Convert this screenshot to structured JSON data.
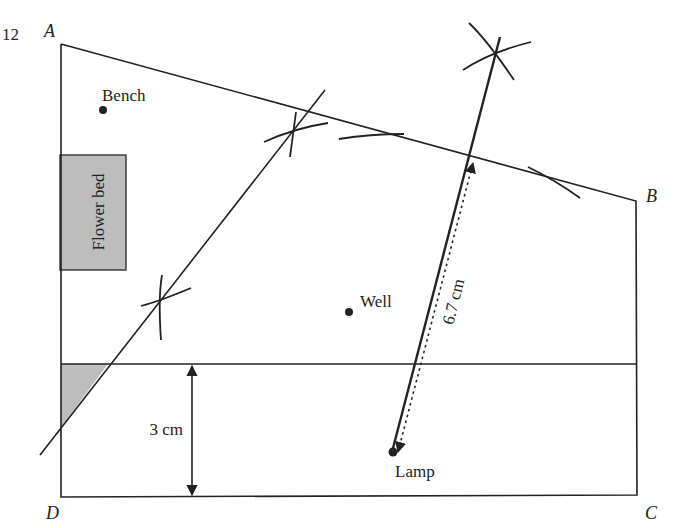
{
  "question_number": "12",
  "vertices": {
    "A": {
      "label": "A",
      "x": 61,
      "y": 44
    },
    "B": {
      "label": "B",
      "x": 636,
      "y": 201
    },
    "C": {
      "label": "C",
      "x": 637,
      "y": 495
    },
    "D": {
      "label": "D",
      "x": 61,
      "y": 497
    }
  },
  "points": {
    "bench": {
      "label": "Bench",
      "x": 103,
      "y": 110
    },
    "well": {
      "label": "Well",
      "x": 349,
      "y": 312
    },
    "lamp": {
      "label": "Lamp",
      "x": 392,
      "y": 452
    }
  },
  "flower_bed": {
    "label": "Flower bed",
    "x": 60,
    "y": 155,
    "width": 66,
    "height": 115,
    "fill": "#bdbdbd"
  },
  "horizontal_line_y": 364,
  "measurements": {
    "distance_3cm": {
      "label": "3 cm"
    },
    "distance_6_7cm": {
      "label": "6.7 cm"
    }
  },
  "colors": {
    "line": "#222222",
    "shade": "#bdbdbd",
    "background": "#ffffff"
  }
}
